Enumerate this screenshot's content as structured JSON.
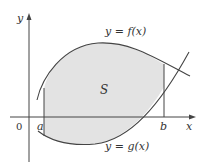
{
  "diagram": {
    "labels": {
      "y_axis": "y",
      "x_axis": "x",
      "origin": "0",
      "a": "a",
      "b": "b",
      "region": "S",
      "f_curve": "y = f(x)",
      "g_curve": "y = g(x)"
    },
    "colors": {
      "fill": "#e3e3e3",
      "stroke": "#444444",
      "text": "#333333"
    }
  }
}
